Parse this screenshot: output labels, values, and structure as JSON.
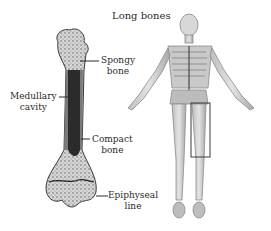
{
  "title": "Long bones",
  "labels": {
    "spongy": [
      "Spongy",
      "bone"
    ],
    "medullary": [
      "Medullary",
      "cavity"
    ],
    "compact": [
      "Compact",
      "bone"
    ],
    "epiphyseal": [
      "Epiphyseal",
      "line"
    ]
  },
  "colors": {
    "bone_dark": "#2b2b2b",
    "bone_mid": "#7a7a7a",
    "bone_light": "#cfcfcf",
    "skeleton": "#9a9a9a",
    "text": "#2a2a2a"
  }
}
